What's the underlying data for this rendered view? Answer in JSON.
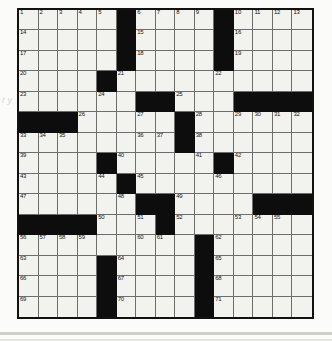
{
  "puzzle": {
    "title": "crossword-grid",
    "rows": 15,
    "cols": 15,
    "colors": {
      "block": "#0d0d0d",
      "cell": "#f2f2ee",
      "grid_line": "#6d6d6d",
      "border": "#111111",
      "page": "#fbfbf9"
    },
    "margin_note": "r\ny",
    "grid": [
      [
        "1",
        "2",
        "3",
        "4",
        "5",
        "#",
        "6",
        "7",
        "8",
        "9",
        "#",
        "10",
        "11",
        "12",
        "13"
      ],
      [
        "14",
        "",
        "",
        "",
        "",
        "#",
        "15",
        "",
        "",
        "",
        "#",
        "16",
        "",
        "",
        ""
      ],
      [
        "17",
        "",
        "",
        "",
        "",
        "#",
        "18",
        "",
        "",
        "",
        "#",
        "19",
        "",
        "",
        ""
      ],
      [
        "20",
        "",
        "",
        "",
        "#",
        "21",
        "",
        "",
        "",
        "",
        "22",
        "",
        "",
        "",
        ""
      ],
      [
        "23",
        "",
        "",
        "",
        "24",
        "",
        "#",
        "#",
        "25",
        "",
        "",
        "#",
        "#",
        "#",
        "#"
      ],
      [
        "#",
        "#",
        "#",
        "26",
        "",
        "",
        "27",
        "",
        "#",
        "28",
        "",
        "29",
        "30",
        "31",
        "32"
      ],
      [
        "33",
        "34",
        "35",
        "",
        "",
        "",
        "36",
        "37",
        "#",
        "38",
        "",
        "",
        "",
        "",
        ""
      ],
      [
        "39",
        "",
        "",
        "",
        "#",
        "40",
        "",
        "",
        "",
        "41",
        "#",
        "42",
        "",
        "",
        ""
      ],
      [
        "43",
        "",
        "",
        "",
        "44",
        "#",
        "45",
        "",
        "",
        "",
        "46",
        "",
        "",
        "",
        ""
      ],
      [
        "47",
        "",
        "",
        "",
        "",
        "48",
        "#",
        "#",
        "49",
        "",
        "",
        "",
        "#",
        "#",
        "#"
      ],
      [
        "#",
        "#",
        "#",
        "#",
        "50",
        "",
        "51",
        "#",
        "52",
        "",
        "",
        "53",
        "54",
        "55",
        ""
      ],
      [
        "56",
        "57",
        "58",
        "59",
        "",
        "",
        "60",
        "61",
        "",
        "#",
        "62",
        "",
        "",
        "",
        ""
      ],
      [
        "63",
        "",
        "",
        "",
        "#",
        "64",
        "",
        "",
        "",
        "#",
        "65",
        "",
        "",
        "",
        ""
      ],
      [
        "66",
        "",
        "",
        "",
        "#",
        "67",
        "",
        "",
        "",
        "#",
        "68",
        "",
        "",
        "",
        ""
      ],
      [
        "69",
        "",
        "",
        "",
        "#",
        "70",
        "",
        "",
        "",
        "#",
        "71",
        "",
        "",
        "",
        ""
      ]
    ]
  }
}
